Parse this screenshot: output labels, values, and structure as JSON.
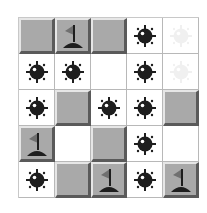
{
  "board": {
    "rows": 5,
    "cols": 5,
    "cells": [
      [
        "covered",
        "flag",
        "covered",
        "mine",
        "ghost-mine"
      ],
      [
        "mine",
        "mine",
        "empty",
        "mine",
        "ghost-mine"
      ],
      [
        "mine",
        "covered",
        "mine",
        "mine",
        "covered"
      ],
      [
        "flag",
        "empty",
        "covered",
        "mine",
        "empty"
      ],
      [
        "mine",
        "covered",
        "flag",
        "mine",
        "flag"
      ]
    ]
  },
  "colors": {
    "covered": "#a9a9a9",
    "revealed": "#ffffff",
    "mine": "#1e1e1e",
    "flag": "#707070"
  }
}
